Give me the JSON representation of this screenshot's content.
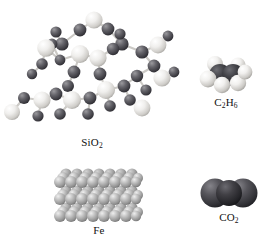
{
  "figure": {
    "background_color": "#ffffff",
    "width": 274,
    "height": 250
  },
  "palette": {
    "silicon_light": "#f2f1ef",
    "silicon_shadow": "#b9b7b3",
    "oxygen_dark": "#555458",
    "oxygen_shadow": "#2c2b2f",
    "carbon_dark": "#3a3a3e",
    "carbon_shadow": "#1d1d21",
    "hydrogen_light": "#f6f5f3",
    "hydrogen_shadow": "#bcbab6",
    "iron_gray": "#a8a8a8",
    "iron_shadow": "#6f6f6f",
    "bond_gray": "#c9c7c3",
    "label_color": "#111111"
  },
  "panels": [
    {
      "id": "sio2",
      "label": "SiO2",
      "label_parts": {
        "lead": "SiO",
        "sub": "2",
        "trail": ""
      },
      "model_type": "ball-and-stick-network",
      "description": "covalent network of silicon and oxygen atoms",
      "atoms": [
        "Si",
        "O"
      ],
      "atom_colors": {
        "Si": "#f2f1ef",
        "O": "#555458"
      }
    },
    {
      "id": "c2h6",
      "label": "C2H6",
      "label_parts": {
        "lead": "C",
        "sub": "2",
        "mid": "H",
        "sub2": "6"
      },
      "model_type": "space-filling",
      "description": "ethane molecule, two carbons and six hydrogens",
      "atoms": [
        "C",
        "H"
      ],
      "atom_colors": {
        "C": "#3a3a3e",
        "H": "#f6f5f3"
      }
    },
    {
      "id": "fe",
      "label": "Fe",
      "label_parts": {
        "lead": "Fe",
        "sub": "",
        "trail": ""
      },
      "model_type": "metallic-lattice",
      "description": "close-packed array of iron atoms",
      "atoms": [
        "Fe"
      ],
      "atom_colors": {
        "Fe": "#a8a8a8"
      }
    },
    {
      "id": "co2",
      "label": "CO2",
      "label_parts": {
        "lead": "CO",
        "sub": "2",
        "trail": ""
      },
      "model_type": "space-filling",
      "description": "linear carbon dioxide molecule",
      "atoms": [
        "C",
        "O"
      ],
      "atom_colors": {
        "C": "#3a3a3e",
        "O": "#46464a"
      }
    }
  ],
  "labels": {
    "sio2_lead": "SiO",
    "sio2_sub": "2",
    "c2h6_c": "C",
    "c2h6_sub_c": "2",
    "c2h6_h": "H",
    "c2h6_sub_h": "6",
    "fe": "Fe",
    "co2_lead": "CO",
    "co2_sub": "2"
  }
}
